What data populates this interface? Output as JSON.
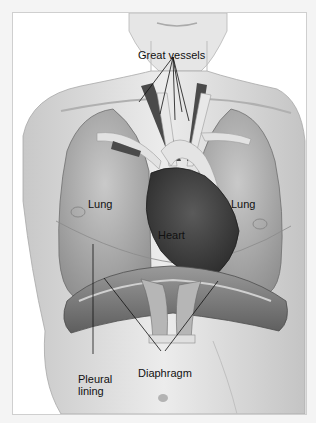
{
  "figure": {
    "colors": {
      "background": "#f4f4f4",
      "panel": "#ffffff",
      "skin": "#d9d9d9",
      "lung": "#a9a9a9",
      "heart": "#3c3c3c",
      "vessel_dark": "#4a4a4a",
      "vessel_light": "#e2e2e2",
      "diaphragm": "#7a7a7a",
      "leader_line": "#111111"
    }
  },
  "labels": {
    "great_vessels": "Great vessels",
    "lung_left": "Lung",
    "lung_right": "Lung",
    "heart": "Heart",
    "pleural_lining": "Pleural\nlining",
    "diaphragm": "Diaphragm"
  }
}
